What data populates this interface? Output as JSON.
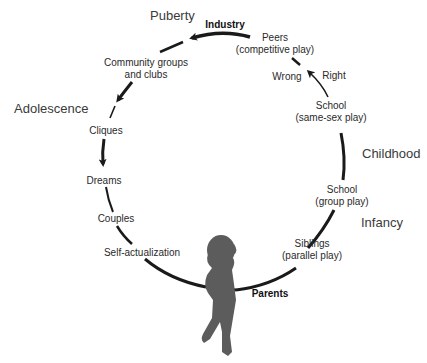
{
  "stages": {
    "puberty": "Puberty",
    "adolescence": "Adolescence",
    "childhood": "Childhood",
    "infancy": "Infancy"
  },
  "nodes": {
    "industry": "Industry",
    "peers_1": "Peers",
    "peers_2": "(competitive play)",
    "wrong": "Wrong",
    "right": "Right",
    "school_ss_1": "School",
    "school_ss_2": "(same-sex play)",
    "school_gp_1": "School",
    "school_gp_2": "(group play)",
    "siblings_1": "Siblings",
    "siblings_2": "(parallel play)",
    "parents": "Parents",
    "self_actualization": "Self-actualization",
    "couples": "Couples",
    "dreams": "Dreams",
    "cliques": "Cliques",
    "community_1": "Community groups",
    "community_2": "and clubs"
  },
  "colors": {
    "line": "#1a1a1a",
    "figure": "#5a5a5a"
  }
}
